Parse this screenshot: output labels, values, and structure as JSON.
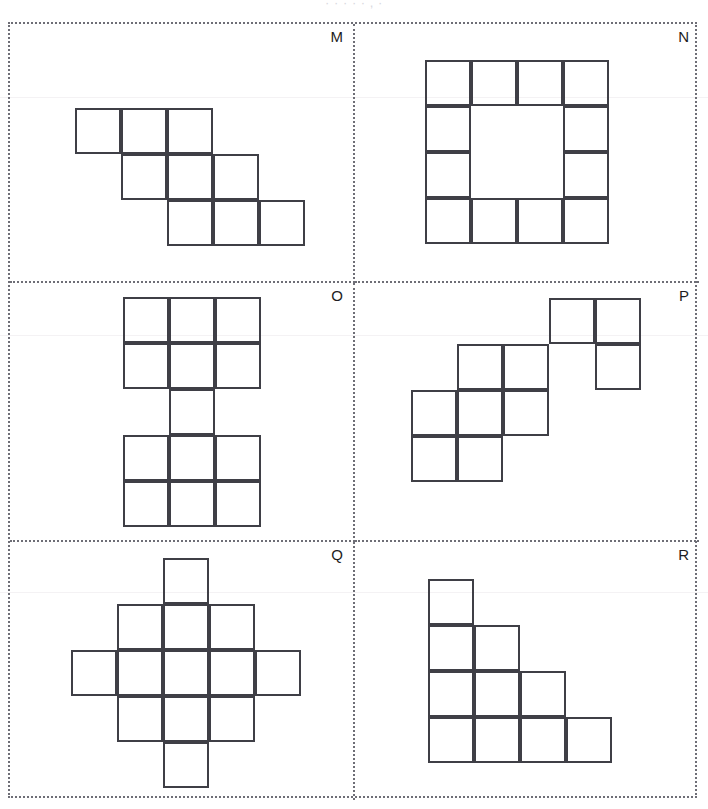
{
  "page": {
    "header_remnant": "· · · · ·  , ·",
    "background_color": "#ffffff",
    "frame_border_color": "#6e6e76",
    "cell_border_color": "#3f3f46",
    "cell_size_px": 46,
    "width_px": 708,
    "height_px": 809
  },
  "panels": [
    {
      "label": "M",
      "shape_name": "diagonal-staircase-nonomino",
      "cell_count": 9,
      "grid_cols": 5,
      "grid_rows": 3,
      "origin": {
        "x": 65,
        "y": 84
      },
      "cells": [
        [
          0,
          0
        ],
        [
          1,
          0
        ],
        [
          2,
          0
        ],
        [
          1,
          1
        ],
        [
          2,
          1
        ],
        [
          3,
          1
        ],
        [
          2,
          2
        ],
        [
          3,
          2
        ],
        [
          4,
          2
        ]
      ]
    },
    {
      "label": "N",
      "shape_name": "hollow-square-ring",
      "cell_count": 12,
      "grid_cols": 4,
      "grid_rows": 4,
      "origin": {
        "x": 70,
        "y": 36
      },
      "cells": [
        [
          0,
          0
        ],
        [
          1,
          0
        ],
        [
          2,
          0
        ],
        [
          3,
          0
        ],
        [
          0,
          1
        ],
        [
          3,
          1
        ],
        [
          0,
          2
        ],
        [
          3,
          2
        ],
        [
          0,
          3
        ],
        [
          1,
          3
        ],
        [
          2,
          3
        ],
        [
          3,
          3
        ]
      ]
    },
    {
      "label": "O",
      "shape_name": "i-beam-shape",
      "cell_count": 13,
      "grid_cols": 3,
      "grid_rows": 5,
      "origin": {
        "x": 113,
        "y": 14
      },
      "cells": [
        [
          0,
          0
        ],
        [
          1,
          0
        ],
        [
          2,
          0
        ],
        [
          0,
          1
        ],
        [
          1,
          1
        ],
        [
          2,
          1
        ],
        [
          1,
          2
        ],
        [
          0,
          3
        ],
        [
          1,
          3
        ],
        [
          2,
          3
        ],
        [
          0,
          4
        ],
        [
          1,
          4
        ],
        [
          2,
          4
        ]
      ]
    },
    {
      "label": "P",
      "shape_name": "three-diagonal-clusters",
      "cell_count": 10,
      "grid_cols": 5,
      "grid_rows": 5,
      "origin": {
        "x": 56,
        "y": 15
      },
      "cells": [
        [
          3,
          0
        ],
        [
          4,
          0
        ],
        [
          4,
          1
        ],
        [
          1,
          1
        ],
        [
          2,
          1
        ],
        [
          1,
          2
        ],
        [
          2,
          2
        ],
        [
          0,
          2
        ],
        [
          0,
          3
        ],
        [
          1,
          3
        ]
      ]
    },
    {
      "label": "Q",
      "shape_name": "plus-diamond-shape",
      "cell_count": 13,
      "grid_cols": 5,
      "grid_rows": 5,
      "origin": {
        "x": 61,
        "y": 16
      },
      "cells": [
        [
          2,
          0
        ],
        [
          1,
          1
        ],
        [
          2,
          1
        ],
        [
          3,
          1
        ],
        [
          0,
          2
        ],
        [
          1,
          2
        ],
        [
          2,
          2
        ],
        [
          3,
          2
        ],
        [
          4,
          2
        ],
        [
          1,
          3
        ],
        [
          2,
          3
        ],
        [
          3,
          3
        ],
        [
          2,
          4
        ]
      ]
    },
    {
      "label": "R",
      "shape_name": "right-triangle-staircase",
      "cell_count": 10,
      "grid_cols": 4,
      "grid_rows": 4,
      "origin": {
        "x": 73,
        "y": 37
      },
      "cells": [
        [
          0,
          0
        ],
        [
          0,
          1
        ],
        [
          1,
          1
        ],
        [
          0,
          2
        ],
        [
          1,
          2
        ],
        [
          2,
          2
        ],
        [
          0,
          3
        ],
        [
          1,
          3
        ],
        [
          2,
          3
        ],
        [
          3,
          3
        ]
      ]
    }
  ]
}
